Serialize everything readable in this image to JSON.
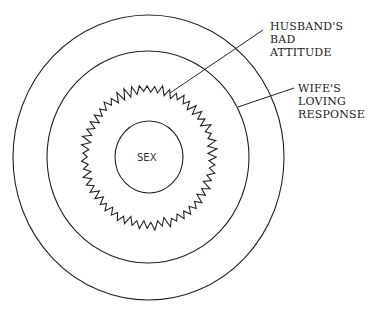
{
  "diagram": {
    "type": "concentric-circles",
    "center_label": "SEX",
    "labels": [
      {
        "line1": "HUSBAND'S BAD",
        "line2": "ATTITUDE",
        "target": "wavy-ring"
      },
      {
        "line1": "WIFE'S",
        "line2": "LOVING",
        "line3": "RESPONSE",
        "target": "middle-circle"
      }
    ],
    "colors": {
      "stroke": "#222222",
      "background": "#ffffff"
    }
  }
}
